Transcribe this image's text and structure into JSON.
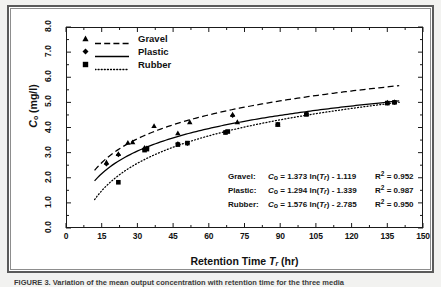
{
  "figure": {
    "caption": "FIGURE 3. Variation of the mean output concentration with retention time for the three media",
    "background_color": "#f2f2f0",
    "frame_color": "#5a5a5a"
  },
  "axes": {
    "x_title_prefix": "Retention Time ",
    "x_title_symbol": "T",
    "x_title_subscript": "r",
    "x_title_suffix": " (hr)",
    "y_title_symbol": "C",
    "y_title_subscript": "o",
    "y_title_suffix": " (mg/l)",
    "x_ticks": [
      "0",
      "15",
      "30",
      "45",
      "60",
      "75",
      "90",
      "105",
      "120",
      "135",
      "150"
    ],
    "y_ticks": [
      "0.0",
      "1.0",
      "2.0",
      "3.0",
      "4.0",
      "5.0",
      "6.0",
      "7.0",
      "8.0"
    ]
  },
  "legend": {
    "entries": [
      {
        "label": "Gravel",
        "marker": "triangle-marker",
        "line_style": "dashed"
      },
      {
        "label": "Plastic",
        "marker": "diamond-marker",
        "line_style": "solid"
      },
      {
        "label": "Rubber",
        "marker": "square-marker",
        "line_style": "dotted"
      }
    ]
  },
  "equations": [
    {
      "name": "Gravel:",
      "y": "C",
      "y_sub": "o",
      "eq": " = 1.373 ln(",
      "var": "T",
      "var_sub": "r",
      "tail": ") - 1.119",
      "r2_label": "R",
      "r2_sup": "2",
      "r2_value": " = 0.952"
    },
    {
      "name": "Plastic:",
      "y": "C",
      "y_sub": "o",
      "eq": " = 1.294 ln(",
      "var": "T",
      "var_sub": "r",
      "tail": ") - 1.339",
      "r2_label": "R",
      "r2_sup": "2",
      "r2_value": " = 0.987"
    },
    {
      "name": "Rubber:",
      "y": "C",
      "y_sub": "o",
      "eq": " = 1.576 ln(",
      "var": "T",
      "var_sub": "r",
      "tail": ") - 2.785",
      "r2_label": "R",
      "r2_sup": "2",
      "r2_value": " = 0.950"
    }
  ],
  "chart_data": {
    "type": "scatter",
    "title": "",
    "xlabel": "Retention Time Tr (hr)",
    "ylabel": "Co (mg/l)",
    "xlim": [
      0,
      150
    ],
    "ylim": [
      0,
      8
    ],
    "xticks": [
      0,
      15,
      30,
      45,
      60,
      75,
      90,
      105,
      120,
      135,
      150
    ],
    "yticks": [
      0,
      1,
      2,
      3,
      4,
      5,
      6,
      7,
      8
    ],
    "grid": false,
    "legend_position": "top-left",
    "minor_ticks": true,
    "series": [
      {
        "name": "Gravel",
        "marker": "triangle",
        "line_style": "dashed",
        "color": "#000000",
        "fit": {
          "form": "a*ln(x)+b",
          "a": 1.373,
          "b": -1.119,
          "r2": 0.952
        },
        "fit_x_range": [
          12,
          140
        ],
        "points": [
          {
            "x": 17,
            "y": 2.62
          },
          {
            "x": 22,
            "y": 2.95
          },
          {
            "x": 26,
            "y": 3.4
          },
          {
            "x": 28,
            "y": 3.42
          },
          {
            "x": 33,
            "y": 3.2
          },
          {
            "x": 37,
            "y": 4.07
          },
          {
            "x": 47,
            "y": 3.78
          },
          {
            "x": 52,
            "y": 4.22
          },
          {
            "x": 70,
            "y": 4.52
          },
          {
            "x": 72,
            "y": 4.22
          },
          {
            "x": 89,
            "y": 4.13
          },
          {
            "x": 101,
            "y": 4.55
          },
          {
            "x": 135,
            "y": 5.0
          },
          {
            "x": 138,
            "y": 5.02
          }
        ]
      },
      {
        "name": "Plastic",
        "marker": "diamond",
        "line_style": "solid",
        "color": "#000000",
        "fit": {
          "form": "a*ln(x)+b",
          "a": 1.294,
          "b": -1.339,
          "r2": 0.987
        },
        "fit_x_range": [
          12,
          140
        ],
        "points": [
          {
            "x": 17,
            "y": 2.55
          },
          {
            "x": 22,
            "y": 2.92
          },
          {
            "x": 33,
            "y": 3.12
          },
          {
            "x": 34,
            "y": 3.18
          },
          {
            "x": 47,
            "y": 3.35
          },
          {
            "x": 51,
            "y": 3.36
          },
          {
            "x": 67,
            "y": 3.82
          },
          {
            "x": 70,
            "y": 4.48
          },
          {
            "x": 89,
            "y": 4.12
          },
          {
            "x": 101,
            "y": 4.55
          },
          {
            "x": 135,
            "y": 4.98
          },
          {
            "x": 138,
            "y": 5.0
          }
        ]
      },
      {
        "name": "Rubber",
        "marker": "square",
        "line_style": "dotted",
        "color": "#000000",
        "fit": {
          "form": "a*ln(x)+b",
          "a": 1.576,
          "b": -2.785,
          "r2": 0.95
        },
        "fit_x_range": [
          12,
          140
        ],
        "points": [
          {
            "x": 22,
            "y": 1.82
          },
          {
            "x": 33,
            "y": 3.1
          },
          {
            "x": 34,
            "y": 3.14
          },
          {
            "x": 47,
            "y": 3.32
          },
          {
            "x": 51,
            "y": 3.38
          },
          {
            "x": 67,
            "y": 3.8
          },
          {
            "x": 68,
            "y": 3.84
          },
          {
            "x": 89,
            "y": 4.12
          },
          {
            "x": 101,
            "y": 4.52
          },
          {
            "x": 135,
            "y": 4.97
          },
          {
            "x": 138,
            "y": 5.0
          }
        ]
      }
    ]
  }
}
